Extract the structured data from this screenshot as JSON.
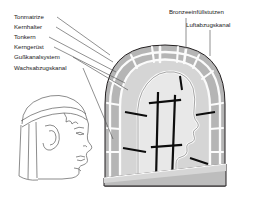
{
  "figure": {
    "title_alt": "Bronzeguss Schnittdarstellung",
    "background_color": "#ffffff",
    "labels_left": [
      {
        "id": "tonmatrize",
        "text": "Tonmatrize"
      },
      {
        "id": "kernhalter",
        "text": "Kernhalter"
      },
      {
        "id": "tonkern",
        "text": "Tonkern"
      },
      {
        "id": "kerngeruest",
        "text": "Kerngerüst"
      },
      {
        "id": "gusskanalsystem",
        "text": "Gußkanalsystem"
      },
      {
        "id": "wachsabzugskanal",
        "text": "Wachsabzugskanal"
      }
    ],
    "labels_right": [
      {
        "id": "bronzeeinfuellstutzen",
        "text": "Bronzeeinfüllstutzen"
      },
      {
        "id": "luftabzugskanal",
        "text": "Luftabzugskanal"
      }
    ],
    "colors": {
      "line": "#231f20",
      "label_text": "#1a1a1a",
      "leader_line": "#3a3a3a",
      "mold_outer_fill": "#b5b5b5",
      "mold_segment_fill": "#c2c2c2",
      "core_fill": "#e3e3e3",
      "base_fill": "#bdbdbd",
      "base_fill_light": "#d2d2d2",
      "channel_white": "#fbfbfb",
      "armature_black": "#0d0d0d",
      "portrait_line": "#4a4a4a"
    }
  }
}
